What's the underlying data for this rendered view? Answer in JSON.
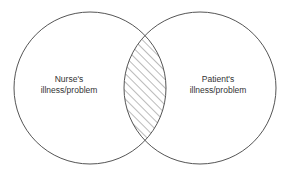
{
  "diagram": {
    "type": "venn",
    "sets": [
      {
        "label_line1": "Nurse's",
        "label_line2": "illness/problem"
      },
      {
        "label_line1": "Patient's",
        "label_line2": "illness/problem"
      }
    ],
    "intersection": {
      "style": "hatched"
    },
    "colors": {
      "stroke": "#555555",
      "hatch": "#555555",
      "background": "#ffffff"
    }
  }
}
